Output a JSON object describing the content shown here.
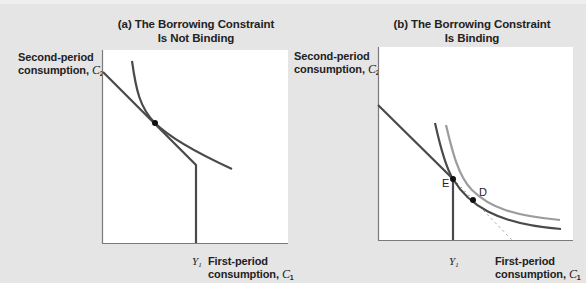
{
  "panels": [
    {
      "id": "a",
      "title_line1": "(a) The Borrowing Constraint",
      "title_line2": "Is Not Binding",
      "y_axis_label_line1": "Second-period",
      "y_axis_label_line2": "consumption, ",
      "y_axis_var": "C",
      "y_axis_sub": "2",
      "x_axis_label_line1": "First-period",
      "x_axis_label_line2": "consumption, ",
      "x_axis_var": "C",
      "x_axis_sub": "1",
      "x_tick_var": "Y",
      "x_tick_sub": "1",
      "curves": [
        "budget-line-with-constraint",
        "indifference-curve"
      ],
      "points": [
        {
          "name": "optimum",
          "label": ""
        }
      ]
    },
    {
      "id": "b",
      "title_line1": "(b) The Borrowing Constraint",
      "title_line2": "Is Binding",
      "y_axis_label_line1": "Second-period",
      "y_axis_label_line2": "consumption, ",
      "y_axis_var": "C",
      "y_axis_sub": "2",
      "x_axis_label_line1": "First-period",
      "x_axis_label_line2": "consumption, ",
      "x_axis_var": "C",
      "x_axis_sub": "1",
      "x_tick_var": "Y",
      "x_tick_sub": "1",
      "curves": [
        "budget-line-with-constraint",
        "indifference-curve-attained",
        "indifference-curve-desired",
        "unconstrained-budget-extension"
      ],
      "points": [
        {
          "name": "point-E",
          "label": "E"
        },
        {
          "name": "point-D",
          "label": "D"
        }
      ]
    }
  ],
  "colors": {
    "background": "#e5e5e5",
    "plot_bg": "#ffffff",
    "line_dark": "#4a4a4a",
    "line_light": "#9c9c9c",
    "axis": "#7a7a7a",
    "dot": "#111111"
  }
}
